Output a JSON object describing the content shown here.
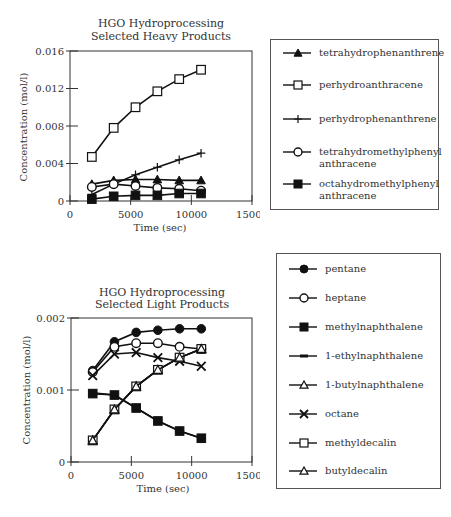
{
  "charts": [
    {
      "title_line1": "HGO Hydroprocessing",
      "title_line2": "Selected Heavy Products",
      "xlabel": "Time (sec)",
      "ylabel": "Concentration (mol/l)",
      "xticks": [
        "0",
        "5000",
        "10000",
        "15000"
      ],
      "yticks": [
        "0",
        "0.004",
        "0.008",
        "0.012",
        "0.016"
      ],
      "legend": [
        {
          "label_line1": "tetrahydrophenanthrene",
          "label_line2": "",
          "marker": "triangle-filled"
        },
        {
          "label_line1": "perhydroanthracene",
          "label_line2": "",
          "marker": "square-open"
        },
        {
          "label_line1": "perhydrophenanthrene",
          "label_line2": "",
          "marker": "plus"
        },
        {
          "label_line1": "tetrahydromethylphenyl",
          "label_line2": "anthracene",
          "marker": "circle-open"
        },
        {
          "label_line1": "octahydromethylphenyl",
          "label_line2": "anthracene",
          "marker": "square-filled"
        }
      ]
    },
    {
      "title_line1": "HGO Hydroprocessing",
      "title_line2": "Selected Light Products",
      "xlabel": "Time (sec)",
      "ylabel": "Concentration (mol/l)",
      "xticks": [
        "0",
        "5000",
        "10000",
        "15000"
      ],
      "yticks": [
        "0",
        "0.001",
        "0.002"
      ],
      "legend": [
        {
          "label_line1": "pentane",
          "marker": "circle-filled"
        },
        {
          "label_line1": "heptane",
          "marker": "circle-open"
        },
        {
          "label_line1": "methylnaphthalene",
          "marker": "square-filled"
        },
        {
          "label_line1": "1-ethylnaphthalene",
          "marker": "dash"
        },
        {
          "label_line1": "1-butylnaphthalene",
          "marker": "triangle-open"
        },
        {
          "label_line1": "octane",
          "marker": "x"
        },
        {
          "label_line1": "methyldecalin",
          "marker": "square-open"
        },
        {
          "label_line1": "butyldecalin",
          "marker": "triangle-open"
        }
      ]
    }
  ],
  "chart_data": [
    {
      "type": "line",
      "title": "HGO Hydroprocessing Selected Heavy Products",
      "xlabel": "Time (sec)",
      "ylabel": "Concentration (mol/l)",
      "xlim": [
        0,
        15000
      ],
      "ylim": [
        0,
        0.016
      ],
      "grid": false,
      "legend_position": "right",
      "x": [
        1800,
        3600,
        5400,
        7200,
        9000,
        10800
      ],
      "series": [
        {
          "name": "tetrahydrophenanthrene",
          "marker": "triangle-filled",
          "values": [
            0.0018,
            0.0022,
            0.0023,
            0.0023,
            0.0022,
            0.0022
          ]
        },
        {
          "name": "perhydroanthracene",
          "marker": "square-open",
          "values": [
            0.0047,
            0.0078,
            0.01,
            0.0117,
            0.013,
            0.014
          ]
        },
        {
          "name": "perhydrophenanthrene",
          "marker": "plus",
          "values": [
            0.0007,
            0.0018,
            0.0028,
            0.0036,
            0.0044,
            0.0051
          ]
        },
        {
          "name": "tetrahydromethylphenyl anthracene",
          "marker": "circle-open",
          "values": [
            0.0015,
            0.0018,
            0.0016,
            0.0014,
            0.0013,
            0.0011
          ]
        },
        {
          "name": "octahydromethylphenyl anthracene",
          "marker": "square-filled",
          "values": [
            0.0002,
            0.0005,
            0.0006,
            0.0006,
            0.0008,
            0.0008
          ]
        }
      ]
    },
    {
      "type": "line",
      "title": "HGO Hydroprocessing Selected Light Products",
      "xlabel": "Time (sec)",
      "ylabel": "Concentration (mol/l)",
      "xlim": [
        0,
        15000
      ],
      "ylim": [
        0,
        0.002
      ],
      "grid": false,
      "legend_position": "right",
      "x": [
        1800,
        3600,
        5400,
        7200,
        9000,
        10800
      ],
      "series": [
        {
          "name": "pentane",
          "marker": "circle-filled",
          "values": [
            0.00127,
            0.00167,
            0.0018,
            0.00183,
            0.00185,
            0.00185
          ]
        },
        {
          "name": "heptane",
          "marker": "circle-open",
          "values": [
            0.00125,
            0.0016,
            0.00165,
            0.00165,
            0.0016,
            0.00157
          ]
        },
        {
          "name": "methylnaphthalene",
          "marker": "square-filled",
          "values": [
            0.00095,
            0.00093,
            0.00075,
            0.00057,
            0.00043,
            0.00033
          ]
        },
        {
          "name": "1-ethylnaphthalene",
          "marker": "dash",
          "values": [
            0.00096,
            0.00093,
            0.00075,
            0.00057,
            0.00043,
            0.00033
          ]
        },
        {
          "name": "1-butylnaphthalene",
          "marker": "triangle-open",
          "values": [
            0.0003,
            0.00073,
            0.00105,
            0.00128,
            0.00145,
            0.00157
          ]
        },
        {
          "name": "octane",
          "marker": "x",
          "values": [
            0.0012,
            0.0015,
            0.00152,
            0.00145,
            0.0014,
            0.00133
          ]
        },
        {
          "name": "methyldecalin",
          "marker": "square-open",
          "values": [
            0.0003,
            0.00073,
            0.00105,
            0.00128,
            0.00145,
            0.00157
          ]
        },
        {
          "name": "butyldecalin",
          "marker": "triangle-open",
          "values": [
            0.0003,
            0.00073,
            0.00105,
            0.00128,
            0.00145,
            0.00157
          ]
        }
      ]
    }
  ]
}
